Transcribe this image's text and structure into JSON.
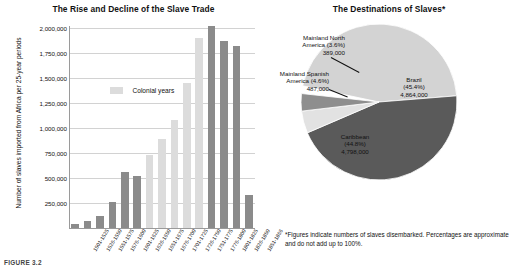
{
  "figure": {
    "caption": "FIGURE 3.2"
  },
  "bar_chart_panel": {
    "title": "The Rise and Decline of the Slave Trade",
    "ylabel": "Number of slaves imported from Africa\nper 25-year periods",
    "legend_label": "Colonial years"
  },
  "pie_chart_panel": {
    "title": "The Destinations of Slaves*",
    "footnote": "*Figures indicate numbers of slaves disembarked.\nPercentages are approximate and do not add up to 100%."
  },
  "colors": {
    "colonial_bar": "#dcdcdc",
    "post_colonial_bar": "#8b8b8b",
    "brazil_slice": "#d3d3d3",
    "mainland_north_america_slice": "#8e8e8e",
    "mainland_spanish_america_slice": "#e2e2e2",
    "caribbean_slice": "#5a5a5a",
    "gridline": "#d2d2d2"
  },
  "chart_data": [
    {
      "type": "bar",
      "title": "The Rise and Decline of the Slave Trade",
      "xlabel": "",
      "ylabel": "Number of slaves imported from Africa per 25-year periods",
      "ylim": [
        0,
        2000000
      ],
      "yticks": [
        "250,000",
        "500,000",
        "750,000",
        "1,000,000",
        "1,250,000",
        "1,500,000",
        "1,750,000",
        "2,000,000"
      ],
      "ytick_values": [
        250000,
        500000,
        750000,
        1000000,
        1250000,
        1500000,
        1750000,
        2000000
      ],
      "grid": true,
      "legend": [
        "Colonial years"
      ],
      "legend_position": "inside-upper-left",
      "categories": [
        "1501-1525",
        "1526-1550",
        "1551-1575",
        "1576-1600",
        "1601-1625",
        "1626-1650",
        "1651-1675",
        "1676-1700",
        "1701-1725",
        "1726-1750",
        "1751-1775",
        "1776-1800",
        "1801-1825",
        "1826-1850",
        "1851-1866"
      ],
      "values": [
        40000,
        70000,
        120000,
        260000,
        560000,
        520000,
        730000,
        890000,
        1080000,
        1450000,
        1900000,
        2020000,
        1870000,
        1820000,
        330000
      ],
      "series_group": [
        "post",
        "post",
        "post",
        "post",
        "post",
        "post",
        "colonial",
        "colonial",
        "colonial",
        "colonial",
        "colonial",
        "post",
        "post",
        "post",
        "post"
      ]
    },
    {
      "type": "pie",
      "title": "The Destinations of Slaves*",
      "slices": [
        {
          "label": "Brazil",
          "percent_text": "(45.4%)",
          "value_text": "4,864,000",
          "percent": 45.4,
          "value": 4864000,
          "color": "#d3d3d3"
        },
        {
          "label": "Caribbean",
          "percent_text": "(44.8%)",
          "value_text": "4,798,000",
          "percent": 44.8,
          "value": 4798000,
          "color": "#5a5a5a"
        },
        {
          "label": "Mainland Spanish\nAmerica (4.6%)\n487,000",
          "percent_text": "(4.6%)",
          "value_text": "487,000",
          "percent": 4.6,
          "value": 487000,
          "color": "#e2e2e2"
        },
        {
          "label": "Mainland North\nAmerica (3.6%)\n389,000",
          "percent_text": "(3.6%)",
          "value_text": "389,000",
          "percent": 3.6,
          "value": 389000,
          "color": "#8e8e8e"
        }
      ],
      "footnote": "*Figures indicate numbers of slaves disembarked.\nPercentages are approximate and do not add up to 100%."
    }
  ],
  "pie_labels": {
    "brazil": "Brazil\n(45.4%)\n4,864,000",
    "caribbean": "Caribbean\n(44.8%)\n4,798,000",
    "mainland_spanish": "Mainland Spanish\nAmerica (4.6%)\n487,000",
    "mainland_north": "Mainland North\nAmerica (3.6%)\n389,000"
  }
}
